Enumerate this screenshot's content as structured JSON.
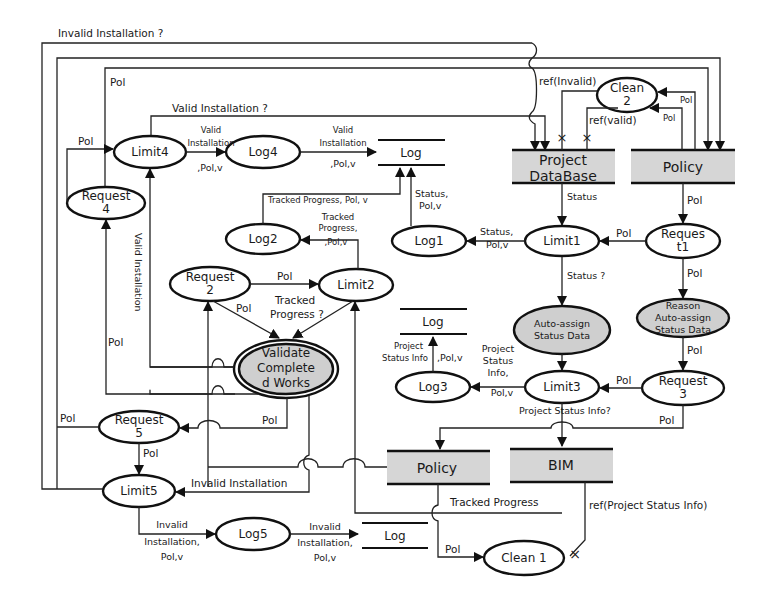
{
  "diagram": {
    "type": "petri-net-workflow",
    "stores": {
      "project_database": {
        "line1": "Project",
        "line2": "DataBase"
      },
      "policy_top": {
        "label": "Policy"
      },
      "policy_bottom": {
        "label": "Policy"
      },
      "bim": {
        "label": "BIM"
      },
      "log_top": {
        "label": "Log"
      },
      "log_mid": {
        "label": "Log"
      },
      "log_bottom": {
        "label": "Log"
      }
    },
    "nodes": {
      "limit4": {
        "label": "Limit4"
      },
      "log4": {
        "label": "Log4"
      },
      "request4": {
        "line1": "Request",
        "line2": "4"
      },
      "log2": {
        "label": "Log2"
      },
      "log1": {
        "label": "Log1"
      },
      "limit1": {
        "label": "Limit1"
      },
      "request1": {
        "line1": "Reques",
        "line2": "t1"
      },
      "clean2": {
        "line1": "Clean",
        "line2": "2"
      },
      "request2": {
        "line1": "Request",
        "line2": "2"
      },
      "limit2": {
        "label": "Limit2"
      },
      "validate": {
        "line1": "Validate",
        "line2": "Complete",
        "line3": "d Works"
      },
      "auto_assign": {
        "line1": "Auto-assign",
        "line2": "Status Data"
      },
      "reason_auto_assign": {
        "line1": "Reason",
        "line2": "Auto-assign",
        "line3": "Status Data"
      },
      "log3": {
        "label": "Log3"
      },
      "limit3": {
        "label": "Limit3"
      },
      "request3": {
        "line1": "Request",
        "line2": "3"
      },
      "request5": {
        "line1": "Request",
        "line2": "5"
      },
      "limit5": {
        "label": "Limit5"
      },
      "log5": {
        "label": "Log5"
      },
      "clean1": {
        "label": "Clean 1"
      }
    },
    "edge_labels": {
      "invalid_installation_q": "Invalid Installation ?",
      "pol_top": "Pol",
      "valid_installation_q": "Valid Installation ?",
      "pol_req4_limit4": "Pol",
      "limit4_log4_l1": "Valid",
      "limit4_log4_l2": "Installation",
      "limit4_log4_l3": ",Pol,v",
      "log4_log_l1": "Valid",
      "log4_log_l2": "Installation",
      "log4_log_l3": ",Pol,v",
      "ref_invalid": "ref(Invalid)",
      "ref_valid": "ref(valid)",
      "pol_clean2_a": "Pol",
      "pol_clean2_b": "Pol",
      "tracked_progress_pol_v": "Tracked Progress, Pol, v",
      "log1_log_l1": "Status,",
      "log1_log_l2": "Pol,v",
      "status_db": "Status",
      "pol_policy_req1": "Pol",
      "limit2_log2_l1": "Tracked",
      "limit2_log2_l2": "Progress,",
      "limit2_log2_l3": ",Pol,v",
      "limit1_log1_l1": "Status,",
      "limit1_log1_l2": "Pol,v",
      "pol_req1_limit1": "Pol",
      "valid_installation_vert": "Valid Installation",
      "pol_req2_limit2": "Pol",
      "pol_req2_validate": "Pol",
      "tracked_progress_q_l1": "Tracked",
      "tracked_progress_q_l2": "Progress ?",
      "status_q": "Status ?",
      "pol_req1_reason": "Pol",
      "pol_req4_vert": "Pol",
      "log3_log_l1": "Project",
      "log3_log_l2": "Status Info",
      "log3_log_l3": ",Pol,v",
      "limit3_log3_l1": "Project",
      "limit3_log3_l2": "Status",
      "limit3_log3_l3": "Info,",
      "limit3_log3_l4": "Pol,v",
      "pol_reason_req3": "Pol",
      "pol_req3_limit3": "Pol",
      "project_status_info_q": "Project Status Info?",
      "pol_req3_down": "Pol",
      "pol_req5_left": "Pol",
      "pol_validate_req5": "Pol",
      "pol_req5_limit5": "Pol",
      "invalid_installation": "Invalid Installation",
      "tracked_progress": "Tracked Progress",
      "ref_project_status_info": "ref(Project Status Info)",
      "limit5_log5_l1": "Invalid",
      "limit5_log5_l2": "Installation,",
      "limit5_log5_l3": "Pol,v",
      "log5_log_l1": "Invalid",
      "log5_log_l2": "Installation,",
      "log5_log_l3": "Pol,v",
      "pol_clean1": "Pol"
    },
    "colors": {
      "line": "#222222",
      "store_fill": "#d6d6d6",
      "activity_fill": "#cfcfcf",
      "background": "#ffffff"
    }
  }
}
